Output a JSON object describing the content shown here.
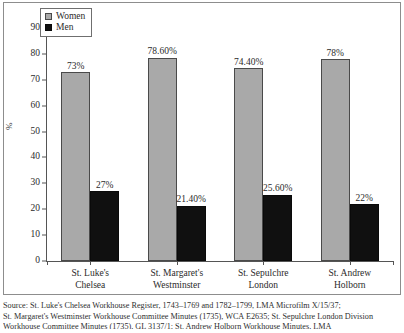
{
  "chart_data": {
    "type": "bar",
    "title": "",
    "subtitle": "",
    "xlabel": "",
    "ylabel": "%",
    "ylim": [
      0,
      90
    ],
    "ytick_step": 10,
    "yticks": [
      "0",
      "10",
      "20",
      "30",
      "40",
      "50",
      "60",
      "70",
      "80",
      "90"
    ],
    "grid": false,
    "legend_position": "top-left",
    "categories": [
      "St. Luke's\nChelsea",
      "St. Margaret's\nWestminster",
      "St. Sepulchre\nLondon",
      "St. Andrew\nHolborn"
    ],
    "category_lines": [
      [
        "St. Luke's",
        "Chelsea"
      ],
      [
        "St. Margaret's",
        "Westminster"
      ],
      [
        "St. Sepulchre",
        "London"
      ],
      [
        "St. Andrew",
        "Holborn"
      ]
    ],
    "series": [
      {
        "name": "Women",
        "color": "#a9a9a9",
        "values": [
          73,
          78.6,
          74.4,
          78
        ],
        "labels": [
          "73%",
          "78.60%",
          "74.40%",
          "78%"
        ]
      },
      {
        "name": "Men",
        "color": "#101010",
        "values": [
          27,
          21.4,
          25.6,
          22
        ],
        "labels": [
          "27%",
          "21.40%",
          "25.60%",
          "22%"
        ]
      }
    ]
  },
  "legend": {
    "items": [
      {
        "label": "Women",
        "color": "#a9a9a9"
      },
      {
        "label": "Men",
        "color": "#101010"
      }
    ]
  },
  "axis": {
    "y_label": "%"
  },
  "source": {
    "line1": "Source: St. Luke's Chelsea Workhouse Register, 1743–1769 and 1782–1799, LMA Microfilm X/15/37;",
    "line2": "St. Margaret's Westminster Workhouse Committee Minutes (1735), WCA E2635; St. Sepulchre London Division",
    "line3": "Workhouse Committee Minutes (1735), GL 3137/1; St. Andrew Holborn Workhouse Minutes, LMA"
  }
}
